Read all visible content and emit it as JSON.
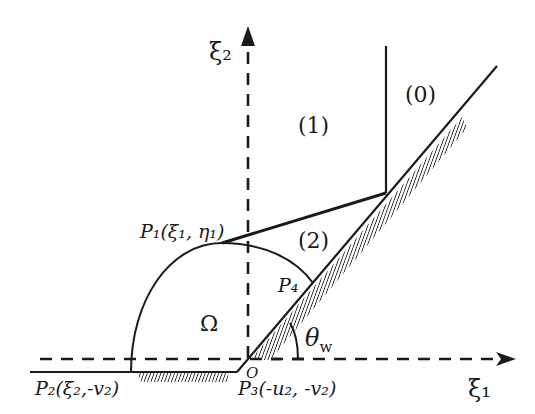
{
  "axes": {
    "x_label": "ξ₁",
    "y_label": "ξ₂",
    "origin_label": "O"
  },
  "regions": {
    "region_0": "(0)",
    "region_1": "(1)",
    "region_2": "(2)",
    "omega": "Ω"
  },
  "points": {
    "p1": "P₁(ξ₁, η₁)",
    "p2": "P₂(ξ₂,-v₂)",
    "p3": "P₃(-u₂, -v₂)",
    "p4": "P₄"
  },
  "angle": {
    "symbol": "θ",
    "subscript": "w"
  },
  "colors": {
    "ink": "#1a1a1a",
    "background": "#ffffff"
  }
}
